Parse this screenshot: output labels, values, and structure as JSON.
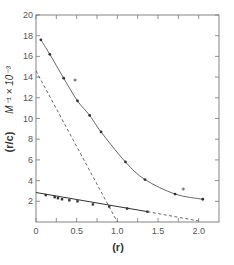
{
  "chart_data": {
    "type": "scatter",
    "title": "",
    "xlabel": "(r)",
    "ylabel": "(r/c)  M⁻¹ × 10⁻³",
    "ylabel_parts": {
      "main": "(r/c)",
      "unit": "M⁻¹ × 10⁻³"
    },
    "xlim": [
      0,
      2.25
    ],
    "ylim": [
      0,
      20
    ],
    "x_ticks": [
      0,
      0.25,
      0.5,
      0.75,
      1.0,
      1.25,
      1.5,
      1.75,
      2.0
    ],
    "x_tick_labels": [
      {
        "value": 0,
        "label": "0"
      },
      {
        "value": 0.5,
        "label": "0.5"
      },
      {
        "value": 1.0,
        "label": "1.0"
      },
      {
        "value": 1.5,
        "label": "1.5"
      },
      {
        "value": 2.0,
        "label": "2.0"
      }
    ],
    "y_ticks": [
      2,
      4,
      6,
      8,
      10,
      12,
      14,
      16,
      18,
      20
    ],
    "y_tick_labels": [
      "2",
      "4",
      "6",
      "8",
      "10",
      "12",
      "14",
      "16",
      "18",
      "20"
    ],
    "grid": false,
    "legend": null,
    "series": [
      {
        "name": "upper curve (data)",
        "style": "solid-curve-with-markers",
        "x": [
          0.06,
          0.17,
          0.34,
          0.51,
          0.66,
          0.8,
          1.1,
          1.34,
          1.71,
          2.05
        ],
        "y": [
          17.6,
          16.2,
          13.9,
          11.7,
          10.3,
          8.7,
          5.8,
          4.1,
          2.7,
          2.2
        ]
      },
      {
        "name": "upper curve outliers",
        "style": "asterisk-markers",
        "x": [
          0.43,
          1.76
        ],
        "y": [
          13.5,
          3.0
        ]
      },
      {
        "name": "lower line (data)",
        "style": "solid-line-with-markers",
        "x": [
          0.0,
          0.12,
          0.23,
          0.27,
          0.32,
          0.41,
          0.51,
          0.7,
          0.9,
          1.12,
          1.37
        ],
        "y": [
          2.85,
          2.6,
          2.4,
          2.3,
          2.2,
          2.1,
          2.0,
          1.7,
          1.5,
          1.3,
          1.0
        ]
      },
      {
        "name": "lower line extrapolation",
        "style": "dashed",
        "x": [
          1.37,
          2.0
        ],
        "y": [
          1.0,
          0.1
        ]
      },
      {
        "name": "dashed line",
        "style": "dashed",
        "x": [
          0.0,
          1.0
        ],
        "y": [
          14.6,
          0.0
        ]
      }
    ]
  }
}
